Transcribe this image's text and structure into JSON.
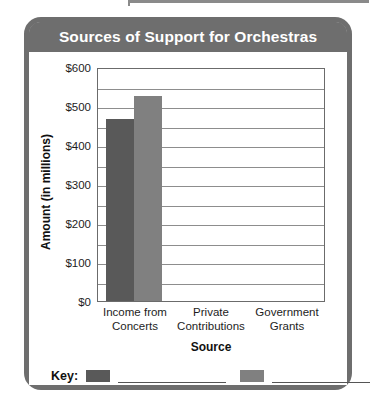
{
  "card": {
    "title": "Sources of Support for Orchestras"
  },
  "key": {
    "label": "Key:",
    "entries": [
      {
        "swatch_color": "#595959",
        "label": ""
      },
      {
        "swatch_color": "#808080",
        "label": ""
      }
    ]
  },
  "chart_data": {
    "type": "bar",
    "title": "Sources of Support for Orchestras",
    "xlabel": "Source",
    "ylabel": "Amount (in millions)",
    "categories": [
      "Income from Concerts",
      "Private Contributions",
      "Government Grants"
    ],
    "category_lines": [
      [
        "Income from",
        "Concerts"
      ],
      [
        "Private",
        "Contributions"
      ],
      [
        "Government",
        "Grants"
      ]
    ],
    "ylim": [
      0,
      600
    ],
    "ytick_labels": [
      "$0",
      "$100",
      "$200",
      "$300",
      "$400",
      "$500",
      "$600"
    ],
    "ytick_values": [
      0,
      100,
      200,
      300,
      400,
      500,
      600
    ],
    "gridline_interval": 50,
    "grid": true,
    "legend_position": "bottom",
    "series": [
      {
        "name": "",
        "color": "#595959",
        "values": [
          467,
          null,
          null
        ]
      },
      {
        "name": "",
        "color": "#808080",
        "values": [
          526,
          null,
          null
        ]
      }
    ],
    "bars": [
      {
        "category": "Income from Concerts",
        "series_index": 0,
        "value": 467,
        "color": "#595959"
      },
      {
        "category": "Income from Concerts",
        "series_index": 1,
        "value": 526,
        "color": "#808080"
      }
    ]
  }
}
